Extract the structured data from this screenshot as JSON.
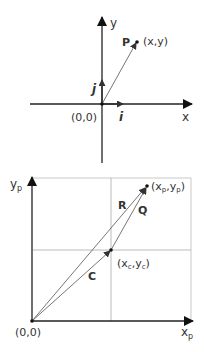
{
  "top_diagram": {
    "y_axis_label": "y",
    "x_axis_label": "x",
    "origin_label": "(0,0)",
    "point_name": "P",
    "point_coords": "(x,y)",
    "unit_vector_i": "i",
    "unit_vector_j": "j"
  },
  "bottom_diagram": {
    "y_axis_label": "y",
    "y_axis_sub": "p",
    "x_axis_label": "x",
    "x_axis_sub": "p",
    "origin_label": "(0,0)",
    "vector_R": "R",
    "vector_Q": "Q",
    "vector_C": "C",
    "point_p_open": "(x",
    "point_p_sub1": "p",
    "point_p_mid": ",y",
    "point_p_sub2": "p",
    "point_p_close": ")",
    "point_c_open": "(x",
    "point_c_sub1": "c",
    "point_c_mid": ",y",
    "point_c_sub2": "c",
    "point_c_close": ")"
  },
  "colors": {
    "axis": "#222222",
    "vector": "#555555",
    "grid": "#aaaaaa",
    "text": "#333333"
  }
}
